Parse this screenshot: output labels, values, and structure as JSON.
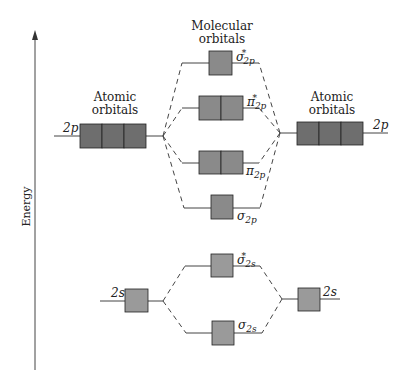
{
  "axis": {
    "label": "Energy",
    "direction": "up"
  },
  "headers": {
    "left": "Atomic orbitals",
    "center": "Molecular orbitals",
    "right": "Atomic orbitals"
  },
  "atomic_orbitals": {
    "left": [
      {
        "label": "2p",
        "boxes": 3
      },
      {
        "label": "2s",
        "boxes": 1
      }
    ],
    "right": [
      {
        "label": "2p",
        "boxes": 3
      },
      {
        "label": "2s",
        "boxes": 1
      }
    ]
  },
  "molecular_orbitals": [
    {
      "sym": "σ",
      "sub": "2p",
      "star": "*",
      "boxes": 1
    },
    {
      "sym": "π",
      "sub": "2p",
      "star": "*",
      "boxes": 2
    },
    {
      "sym": "π",
      "sub": "2p",
      "star": "",
      "boxes": 2
    },
    {
      "sym": "σ",
      "sub": "2p",
      "star": "",
      "boxes": 1
    },
    {
      "sym": "σ",
      "sub": "2s",
      "star": "*",
      "boxes": 1
    },
    {
      "sym": "σ",
      "sub": "2s",
      "star": "",
      "boxes": 1
    }
  ],
  "colors": {
    "ao_2p_box": "#6e6e6e",
    "mo_box": "#8a8a8a",
    "s_box": "#9a9a9a",
    "line": "#444444"
  }
}
